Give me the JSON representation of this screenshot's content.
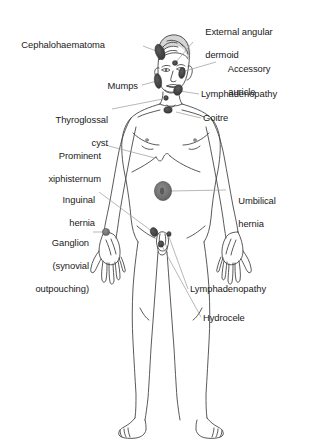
{
  "figure": {
    "colors": {
      "background": "#ffffff",
      "outline": "#3c3c3c",
      "text": "#1a1a1a",
      "leader_line": "#8c8c8c",
      "marker_fill": "#6e6e6e",
      "marker_stroke": "#3a3a3a",
      "hair_fill": "#5a5a5a"
    }
  },
  "labels": [
    {
      "id": "cephalohaematoma",
      "text": "Cephalohaematoma",
      "lines": [
        "Cephalohaematoma"
      ],
      "side": "left",
      "align": "right",
      "x": 38,
      "y": 39,
      "leader": {
        "x1": 143,
        "y1": 46,
        "x2": 159,
        "y2": 52
      }
    },
    {
      "id": "external-angular-dermoid",
      "text": "External angular dermoid",
      "lines": [
        "External angular",
        "dermoid"
      ],
      "side": "right",
      "align": "left",
      "x": 195,
      "y": 15,
      "leader": {
        "x1": 193,
        "y1": 42,
        "x2": 176,
        "y2": 62
      }
    },
    {
      "id": "accessory-auricle",
      "text": "Accessory auricle",
      "lines": [
        "Accessory",
        "auricle"
      ],
      "side": "right",
      "align": "left",
      "x": 218,
      "y": 52,
      "leader": {
        "x1": 216,
        "y1": 62,
        "x2": 185,
        "y2": 71
      }
    },
    {
      "id": "mumps",
      "text": "Mumps",
      "lines": [
        "Mumps"
      ],
      "side": "left",
      "align": "right",
      "x": 108,
      "y": 81,
      "leader": {
        "x1": 142,
        "y1": 85,
        "x2": 157,
        "y2": 81
      }
    },
    {
      "id": "lymphadenopathy-neck",
      "text": "Lymphadenopathy",
      "lines": [
        "Lymphadenopathy"
      ],
      "side": "right",
      "align": "left",
      "x": 201,
      "y": 90,
      "leader": {
        "x1": 199,
        "y1": 94,
        "x2": 180,
        "y2": 91
      }
    },
    {
      "id": "thyroglossal-cyst",
      "text": "Thyroglossal cyst",
      "lines": [
        "Thyroglossal",
        "cyst"
      ],
      "side": "left",
      "align": "right",
      "x": 48,
      "y": 104,
      "leader": {
        "x1": 112,
        "y1": 109,
        "x2": 163,
        "y2": 99
      }
    },
    {
      "id": "goitre",
      "text": "Goitre",
      "lines": [
        "Goitre"
      ],
      "side": "right",
      "align": "left",
      "x": 203,
      "y": 114,
      "leader": {
        "x1": 201,
        "y1": 118,
        "x2": 176,
        "y2": 112
      }
    },
    {
      "id": "prominent-xiphisternum",
      "text": "Prominent xiphisternum",
      "lines": [
        "Prominent",
        "xiphisternum"
      ],
      "side": "left",
      "align": "right",
      "x": 43,
      "y": 140,
      "leader": {
        "x1": 105,
        "y1": 145,
        "x2": 155,
        "y2": 158
      }
    },
    {
      "id": "inguinal-hernia",
      "text": "Inguinal hernia",
      "lines": [
        "Inguinal",
        "hernia"
      ],
      "side": "left",
      "align": "right",
      "x": 52,
      "y": 184,
      "leader": {
        "x1": 99,
        "y1": 192,
        "x2": 153,
        "y2": 232
      }
    },
    {
      "id": "umbilical-hernia",
      "text": "Umbilical hernia",
      "lines": [
        "Umbilical",
        "hernia"
      ],
      "side": "right",
      "align": "left",
      "x": 228,
      "y": 185,
      "leader": {
        "x1": 226,
        "y1": 190,
        "x2": 168,
        "y2": 191
      }
    },
    {
      "id": "ganglion",
      "text": "Ganglion (synovial outpouching)",
      "lines": [
        "Ganglion",
        "(synovial",
        "outpouching)"
      ],
      "side": "left",
      "align": "right",
      "x": 31,
      "y": 227,
      "leader": {
        "x1": 93,
        "y1": 232,
        "x2": 105,
        "y2": 232
      }
    },
    {
      "id": "lymphadenopathy-groin",
      "text": "Lymphadenopathy",
      "lines": [
        "Lymphadenopathy"
      ],
      "side": "right",
      "align": "left",
      "x": 190,
      "y": 285,
      "leader": {
        "x1": 188,
        "y1": 289,
        "x2": 168,
        "y2": 237
      }
    },
    {
      "id": "hydrocele",
      "text": "Hydrocele",
      "lines": [
        "Hydrocele"
      ],
      "side": "right",
      "align": "left",
      "x": 203,
      "y": 313,
      "leader": {
        "x1": 201,
        "y1": 317,
        "x2": 161,
        "y2": 245
      }
    }
  ],
  "markers": [
    {
      "id": "marker-cephalohaematoma",
      "name": "cephalohaematoma-marker",
      "cx": 160,
      "cy": 52,
      "rx": 4.5,
      "ry": 8,
      "rotate": -20,
      "shade": "dark"
    },
    {
      "id": "marker-external-angular-dermoid",
      "name": "external-angular-dermoid-marker",
      "cx": 175,
      "cy": 63,
      "rx": 2.6,
      "ry": 2.4,
      "shade": "dark"
    },
    {
      "id": "marker-accessory-auricle",
      "name": "accessory-auricle-marker",
      "cx": 182,
      "cy": 73,
      "rx": 3.2,
      "ry": 5.5,
      "rotate": 10,
      "shade": "dark"
    },
    {
      "id": "marker-mumps",
      "name": "mumps-marker",
      "cx": 158,
      "cy": 81,
      "rx": 3.6,
      "ry": 7.5,
      "rotate": -8,
      "shade": "dark"
    },
    {
      "id": "marker-lymphadenopathy-neck",
      "name": "lymphadenopathy-neck-marker",
      "cx": 178,
      "cy": 90,
      "rx": 4.2,
      "ry": 5.5,
      "rotate": 25,
      "shade": "dark"
    },
    {
      "id": "marker-thyroglossal-cyst",
      "name": "thyroglossal-cyst-marker",
      "cx": 166,
      "cy": 98,
      "rx": 2.4,
      "ry": 2.4,
      "shade": "dark"
    },
    {
      "id": "marker-goitre",
      "name": "goitre-marker",
      "cx": 168,
      "cy": 110,
      "rx": 4.2,
      "ry": 3.2,
      "shade": "dark"
    },
    {
      "id": "marker-umbilical-hernia",
      "name": "umbilical-hernia-marker",
      "cx": 163,
      "cy": 191,
      "rx": 8.5,
      "ry": 9.5,
      "shade": "mid"
    },
    {
      "id": "marker-inguinal-hernia",
      "name": "inguinal-hernia-marker",
      "cx": 154,
      "cy": 232,
      "rx": 3.6,
      "ry": 4.6,
      "rotate": -25,
      "shade": "dark"
    },
    {
      "id": "marker-ganglion",
      "name": "ganglion-marker",
      "cx": 106,
      "cy": 232,
      "rx": 3.6,
      "ry": 3.6,
      "shade": "mid"
    },
    {
      "id": "marker-lymphadenopathy-groin",
      "name": "lymphadenopathy-groin-marker",
      "cx": 169,
      "cy": 234,
      "rx": 2.2,
      "ry": 2.6,
      "shade": "dark"
    },
    {
      "id": "marker-hydrocele",
      "name": "hydrocele-marker",
      "cx": 161,
      "cy": 244,
      "rx": 2.8,
      "ry": 3.2,
      "shade": "dark"
    }
  ]
}
